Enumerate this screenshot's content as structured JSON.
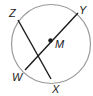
{
  "diagram": {
    "type": "circle-geometry",
    "circle": {
      "center_label": "M",
      "stroke": "#9a9a9a"
    },
    "points": {
      "Z": {
        "label": "Z"
      },
      "Y": {
        "label": "Y"
      },
      "M": {
        "label": "M"
      },
      "W": {
        "label": "W"
      },
      "X": {
        "label": "X"
      }
    },
    "segments": [
      {
        "name": "diameter-WY",
        "from": "W",
        "to": "Y",
        "through": "M"
      },
      {
        "name": "chord-ZX",
        "from": "Z",
        "to": "X"
      }
    ],
    "line_color": "#1a1a1a"
  }
}
